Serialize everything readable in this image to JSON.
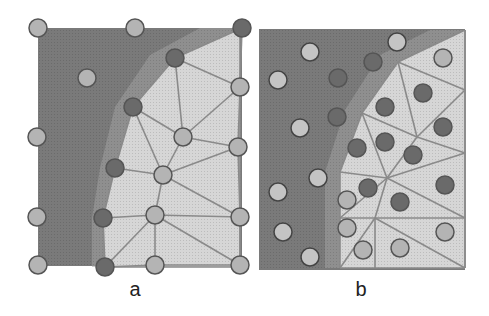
{
  "figure": {
    "colors": {
      "dark_region": "#7a7a7a",
      "light_region": "#d6d6d6",
      "edge": "#8a8a8a",
      "node_light": "#b4b4b4",
      "node_dark": "#6a6a6a",
      "node_stroke": "#555555",
      "node_open": "#c4c4c4"
    },
    "panels": [
      {
        "id": "a",
        "label": "a",
        "label_pos": [
          135,
          292
        ],
        "rect": [
          38,
          28,
          242,
          266
        ],
        "nodes": [
          {
            "x": 38,
            "y": 28,
            "tone": "light"
          },
          {
            "x": 135,
            "y": 28,
            "tone": "light"
          },
          {
            "x": 242,
            "y": 28,
            "tone": "dark"
          },
          {
            "x": 175,
            "y": 58,
            "tone": "dark"
          },
          {
            "x": 87,
            "y": 78,
            "tone": "light"
          },
          {
            "x": 240,
            "y": 87,
            "tone": "light"
          },
          {
            "x": 133,
            "y": 107,
            "tone": "dark"
          },
          {
            "x": 183,
            "y": 137,
            "tone": "light"
          },
          {
            "x": 37,
            "y": 137,
            "tone": "light"
          },
          {
            "x": 238,
            "y": 147,
            "tone": "light"
          },
          {
            "x": 115,
            "y": 168,
            "tone": "dark"
          },
          {
            "x": 163,
            "y": 175,
            "tone": "light"
          },
          {
            "x": 37,
            "y": 217,
            "tone": "light"
          },
          {
            "x": 103,
            "y": 218,
            "tone": "dark"
          },
          {
            "x": 155,
            "y": 215,
            "tone": "light"
          },
          {
            "x": 240,
            "y": 217,
            "tone": "light"
          },
          {
            "x": 38,
            "y": 265,
            "tone": "light"
          },
          {
            "x": 105,
            "y": 267,
            "tone": "dark"
          },
          {
            "x": 155,
            "y": 265,
            "tone": "light"
          },
          {
            "x": 240,
            "y": 265,
            "tone": "light"
          }
        ],
        "edges": [
          [
            2,
            3
          ],
          [
            2,
            5
          ],
          [
            3,
            5
          ],
          [
            3,
            6
          ],
          [
            3,
            7
          ],
          [
            5,
            7
          ],
          [
            5,
            9
          ],
          [
            6,
            7
          ],
          [
            6,
            11
          ],
          [
            7,
            9
          ],
          [
            7,
            11
          ],
          [
            9,
            11
          ],
          [
            9,
            15
          ],
          [
            10,
            11
          ],
          [
            10,
            13
          ],
          [
            11,
            14
          ],
          [
            11,
            15
          ],
          [
            13,
            14
          ],
          [
            14,
            15
          ],
          [
            13,
            17
          ],
          [
            14,
            17
          ],
          [
            14,
            18
          ],
          [
            14,
            19
          ],
          [
            15,
            19
          ],
          [
            17,
            18
          ],
          [
            18,
            19
          ],
          [
            10,
            6
          ]
        ]
      },
      {
        "id": "b",
        "label": "b",
        "label_pos": [
          361,
          292
        ],
        "rect": [
          259,
          29,
          465,
          270
        ],
        "vertices": [
          [
            465,
            30
          ],
          [
            398,
            62
          ],
          [
            465,
            90
          ],
          [
            362,
            113
          ],
          [
            417,
            137
          ],
          [
            465,
            153
          ],
          [
            387,
            178
          ],
          [
            340,
            172
          ],
          [
            340,
            218
          ],
          [
            375,
            218
          ],
          [
            465,
            218
          ],
          [
            340,
            268
          ],
          [
            375,
            268
          ],
          [
            465,
            268
          ]
        ],
        "tri_edges": [
          [
            0,
            1
          ],
          [
            0,
            2
          ],
          [
            1,
            2
          ],
          [
            1,
            3
          ],
          [
            1,
            4
          ],
          [
            2,
            4
          ],
          [
            3,
            4
          ],
          [
            3,
            6
          ],
          [
            3,
            7
          ],
          [
            4,
            5
          ],
          [
            2,
            5
          ],
          [
            4,
            6
          ],
          [
            5,
            6
          ],
          [
            6,
            7
          ],
          [
            6,
            8
          ],
          [
            6,
            9
          ],
          [
            7,
            8
          ],
          [
            8,
            9
          ],
          [
            9,
            10
          ],
          [
            5,
            10
          ],
          [
            6,
            10
          ],
          [
            8,
            11
          ],
          [
            9,
            11
          ],
          [
            9,
            12
          ],
          [
            9,
            13
          ],
          [
            10,
            13
          ],
          [
            11,
            12
          ],
          [
            12,
            13
          ]
        ],
        "points": [
          {
            "x": 310,
            "y": 52,
            "tone": "open"
          },
          {
            "x": 397,
            "y": 42,
            "tone": "open"
          },
          {
            "x": 278,
            "y": 80,
            "tone": "open"
          },
          {
            "x": 300,
            "y": 128,
            "tone": "open"
          },
          {
            "x": 318,
            "y": 178,
            "tone": "open"
          },
          {
            "x": 278,
            "y": 192,
            "tone": "open"
          },
          {
            "x": 283,
            "y": 232,
            "tone": "open"
          },
          {
            "x": 310,
            "y": 257,
            "tone": "open"
          },
          {
            "x": 443,
            "y": 58,
            "tone": "light"
          },
          {
            "x": 347,
            "y": 200,
            "tone": "light"
          },
          {
            "x": 347,
            "y": 228,
            "tone": "light"
          },
          {
            "x": 363,
            "y": 250,
            "tone": "light"
          },
          {
            "x": 400,
            "y": 248,
            "tone": "light"
          },
          {
            "x": 445,
            "y": 232,
            "tone": "light"
          },
          {
            "x": 373,
            "y": 62,
            "tone": "dark"
          },
          {
            "x": 338,
            "y": 78,
            "tone": "dark"
          },
          {
            "x": 337,
            "y": 117,
            "tone": "dark"
          },
          {
            "x": 385,
            "y": 107,
            "tone": "dark"
          },
          {
            "x": 423,
            "y": 93,
            "tone": "dark"
          },
          {
            "x": 443,
            "y": 127,
            "tone": "dark"
          },
          {
            "x": 357,
            "y": 148,
            "tone": "dark"
          },
          {
            "x": 385,
            "y": 142,
            "tone": "dark"
          },
          {
            "x": 413,
            "y": 155,
            "tone": "dark"
          },
          {
            "x": 368,
            "y": 188,
            "tone": "dark"
          },
          {
            "x": 400,
            "y": 202,
            "tone": "dark"
          },
          {
            "x": 445,
            "y": 185,
            "tone": "dark"
          }
        ]
      }
    ]
  }
}
